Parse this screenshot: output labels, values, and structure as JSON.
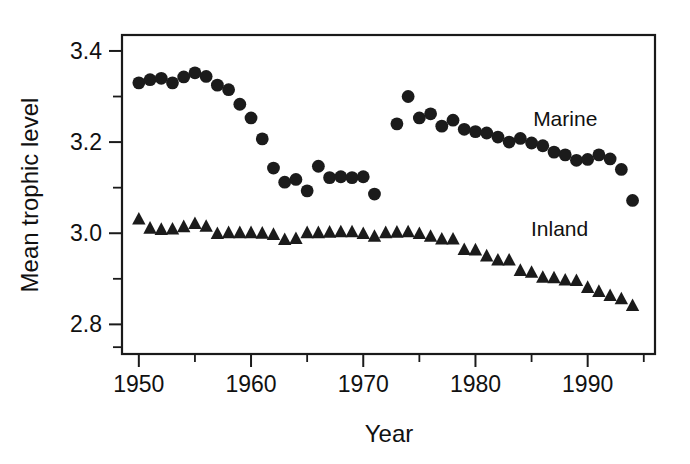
{
  "chart_data": {
    "type": "scatter",
    "title": "",
    "xlabel": "Year",
    "ylabel": "Mean trophic level",
    "xlim": [
      1948.5,
      1996.0
    ],
    "ylim": [
      2.735,
      3.435
    ],
    "grid": false,
    "legend_position": "inline-right",
    "x_ticks_major": [
      1950,
      1960,
      1970,
      1980,
      1990
    ],
    "x_ticks_major_labels": [
      "1950",
      "1960",
      "1970",
      "1980",
      "1990"
    ],
    "x_ticks_minor": [
      1955,
      1965,
      1975,
      1985,
      1995
    ],
    "y_ticks_major": [
      3.4,
      3.2,
      3.0,
      2.8
    ],
    "y_ticks_major_labels": [
      "3.4",
      "3.2",
      "3.0",
      "2.8"
    ],
    "y_ticks_minor": [
      3.3,
      3.1,
      2.9,
      2.75
    ],
    "series": [
      {
        "name": "Marine",
        "marker": "circle",
        "color": "#1b1b1b",
        "label_x": 1988.0,
        "label_y": 3.235,
        "x": [
          1950,
          1951,
          1952,
          1953,
          1954,
          1955,
          1956,
          1957,
          1958,
          1959,
          1960,
          1961,
          1962,
          1963,
          1964,
          1965,
          1966,
          1967,
          1968,
          1969,
          1970,
          1971,
          1973,
          1974,
          1975,
          1976,
          1977,
          1978,
          1979,
          1980,
          1981,
          1982,
          1983,
          1984,
          1985,
          1986,
          1987,
          1988,
          1989,
          1990,
          1991,
          1992,
          1993,
          1994
        ],
        "y": [
          3.33,
          3.337,
          3.34,
          3.33,
          3.343,
          3.352,
          3.344,
          3.325,
          3.315,
          3.283,
          3.253,
          3.207,
          3.143,
          3.112,
          3.118,
          3.093,
          3.147,
          3.122,
          3.124,
          3.122,
          3.124,
          3.086,
          3.24,
          3.3,
          3.253,
          3.262,
          3.235,
          3.248,
          3.228,
          3.223,
          3.22,
          3.211,
          3.2,
          3.208,
          3.198,
          3.192,
          3.178,
          3.172,
          3.16,
          3.162,
          3.172,
          3.163,
          3.14,
          3.072
        ]
      },
      {
        "name": "Inland",
        "marker": "triangle",
        "color": "#1b1b1b",
        "label_x": 1987.5,
        "label_y": 2.995,
        "x": [
          1950,
          1951,
          1952,
          1953,
          1954,
          1955,
          1956,
          1957,
          1958,
          1959,
          1960,
          1961,
          1962,
          1963,
          1964,
          1965,
          1966,
          1967,
          1968,
          1969,
          1970,
          1971,
          1972,
          1973,
          1974,
          1975,
          1976,
          1977,
          1978,
          1979,
          1980,
          1981,
          1982,
          1983,
          1984,
          1985,
          1986,
          1987,
          1988,
          1989,
          1990,
          1991,
          1992,
          1993,
          1994
        ],
        "y": [
          3.03,
          3.01,
          3.007,
          3.008,
          3.013,
          3.02,
          3.014,
          2.998,
          3.0,
          3.0,
          3.0,
          2.999,
          2.996,
          2.985,
          2.987,
          3.0,
          3.0,
          3.001,
          3.002,
          3.002,
          2.998,
          2.992,
          3.0,
          3.001,
          3.002,
          2.998,
          2.992,
          2.986,
          2.986,
          2.963,
          2.962,
          2.949,
          2.94,
          2.94,
          2.917,
          2.913,
          2.902,
          2.901,
          2.896,
          2.895,
          2.88,
          2.871,
          2.862,
          2.855,
          2.84
        ]
      }
    ]
  },
  "axes": {
    "x_title": "Year",
    "y_title": "Mean trophic level"
  },
  "labels": {
    "marine": "Marine",
    "inland": "Inland"
  }
}
